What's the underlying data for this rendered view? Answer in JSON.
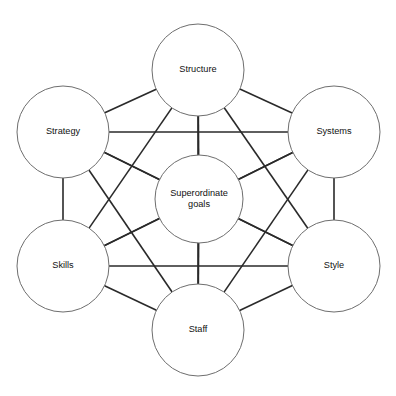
{
  "diagram": {
    "type": "network-hub-and-spoke",
    "canvas": {
      "width": 396,
      "height": 396,
      "background": "#ffffff"
    },
    "style": {
      "circle_fill": "#ffffff",
      "circle_stroke": "#6e6e6e",
      "circle_stroke_width": 1,
      "connector_stroke": "#2a2a2a",
      "connector_stroke_width": 1.6,
      "label_color": "#111111",
      "label_font_size": 9.2
    },
    "nodes": [
      {
        "id": "structure",
        "label": "Structure",
        "lines": [
          "Structure"
        ],
        "cx": 198,
        "cy": 70,
        "r": 46,
        "position": "top"
      },
      {
        "id": "systems",
        "label": "Systems",
        "lines": [
          "Systems"
        ],
        "cx": 334,
        "cy": 132,
        "r": 46,
        "position": "upper-right"
      },
      {
        "id": "style",
        "label": "Style",
        "lines": [
          "Style"
        ],
        "cx": 334,
        "cy": 266,
        "r": 46,
        "position": "lower-right"
      },
      {
        "id": "staff",
        "label": "Staff",
        "lines": [
          "Staff"
        ],
        "cx": 198,
        "cy": 330,
        "r": 46,
        "position": "bottom"
      },
      {
        "id": "skills",
        "label": "Skills",
        "lines": [
          "Skills"
        ],
        "cx": 63,
        "cy": 266,
        "r": 46,
        "position": "lower-left"
      },
      {
        "id": "strategy",
        "label": "Strategy",
        "lines": [
          "Strategy"
        ],
        "cx": 63,
        "cy": 132,
        "r": 46,
        "position": "upper-left"
      },
      {
        "id": "superordinate-goals",
        "label": "Superordinate goals",
        "lines": [
          "Superordinate",
          "goals"
        ],
        "cx": 199,
        "cy": 199,
        "r": 44,
        "position": "center"
      }
    ],
    "edges": [
      {
        "from": "superordinate-goals",
        "to": "structure"
      },
      {
        "from": "superordinate-goals",
        "to": "systems"
      },
      {
        "from": "superordinate-goals",
        "to": "style"
      },
      {
        "from": "superordinate-goals",
        "to": "staff"
      },
      {
        "from": "superordinate-goals",
        "to": "skills"
      },
      {
        "from": "superordinate-goals",
        "to": "strategy"
      },
      {
        "from": "structure",
        "to": "systems"
      },
      {
        "from": "systems",
        "to": "style"
      },
      {
        "from": "style",
        "to": "staff"
      },
      {
        "from": "staff",
        "to": "skills"
      },
      {
        "from": "skills",
        "to": "strategy"
      },
      {
        "from": "strategy",
        "to": "structure"
      },
      {
        "from": "structure",
        "to": "style"
      },
      {
        "from": "structure",
        "to": "skills"
      },
      {
        "from": "systems",
        "to": "staff"
      },
      {
        "from": "systems",
        "to": "skills"
      },
      {
        "from": "style",
        "to": "strategy"
      },
      {
        "from": "staff",
        "to": "strategy"
      },
      {
        "from": "strategy",
        "to": "systems"
      },
      {
        "from": "skills",
        "to": "style"
      },
      {
        "from": "structure",
        "to": "staff"
      }
    ]
  }
}
